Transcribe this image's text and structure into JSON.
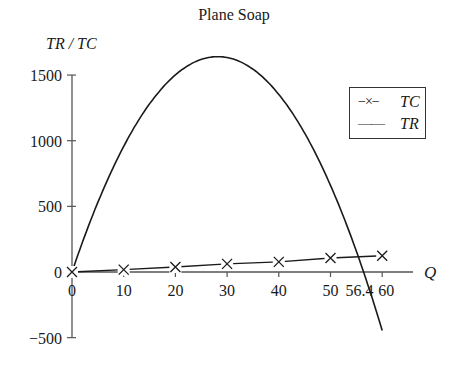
{
  "chart_data": {
    "type": "line",
    "title": "Plane Soap",
    "xlabel": "Q",
    "ylabel": "TR / TC",
    "xlim": [
      0,
      60
    ],
    "ylim": [
      -500,
      1500
    ],
    "grid": false,
    "legend_position": "upper right",
    "x_ticks": [
      "0",
      "10",
      "20",
      "30",
      "40",
      "50",
      "56.4",
      "60"
    ],
    "y_ticks": [
      "1500",
      "1000",
      "500",
      "0",
      "−500"
    ],
    "series": [
      {
        "name": "TC",
        "style": "line-with-x-markers",
        "x": [
          0,
          10,
          20,
          30,
          40,
          50,
          60
        ],
        "values": [
          0,
          18,
          38,
          62,
          77,
          107,
          124
        ]
      },
      {
        "name": "TR",
        "style": "solid-line",
        "x": [
          0,
          5,
          10,
          15,
          20,
          25,
          28.2,
          30,
          35,
          40,
          45,
          50,
          56.4,
          60
        ],
        "values": [
          0,
          530,
          955,
          1280,
          1500,
          1620,
          1640,
          1635,
          1535,
          1335,
          1055,
          660,
          0,
          -445
        ]
      }
    ],
    "annotations": [
      {
        "text": "56.4",
        "x": 56.4,
        "note": "TR crosses zero"
      }
    ]
  },
  "legend": {
    "items": [
      {
        "symbol": "−×−",
        "label": "TC"
      },
      {
        "symbol": "——",
        "label": "TR"
      }
    ]
  },
  "colors": {
    "line": "#1a1a1a",
    "axis": "#555555",
    "background": "#ffffff"
  }
}
